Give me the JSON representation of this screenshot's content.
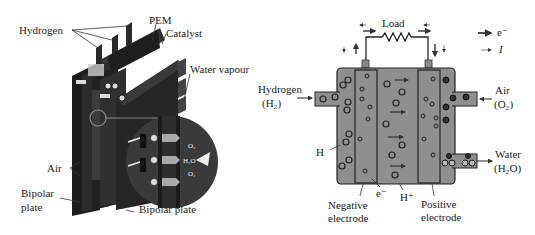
{
  "left_figure": {
    "labels": {
      "hydrogen": "Hydrogen",
      "pem": "PEM",
      "catalyst": "Catalyst",
      "water_vapour": "Water vapour",
      "air": "Air",
      "bipolar_plate_left_1": "Bipolar",
      "bipolar_plate_left_2": "plate",
      "bipolar_plate_right": "Bipolar plate"
    },
    "inset_labels": {
      "o2_top": "O₂",
      "h2o": "H₂O",
      "o2_bottom": "O₂"
    }
  },
  "right_figure": {
    "labels": {
      "load": "Load",
      "hydrogen": "Hydrogen",
      "hydrogen_formula": "(H₂)",
      "air": "Air",
      "air_formula": "(O₂)",
      "water": "Water",
      "water_formula": "(H₂O)",
      "h": "H",
      "electron": "e⁻",
      "proton": "H⁺",
      "negative_electrode_1": "Negative",
      "negative_electrode_2": "electrode",
      "positive_electrode_1": "Positive",
      "positive_electrode_2": "electrode"
    },
    "legend": [
      {
        "symbol": "thick-arrow",
        "label": "e⁻"
      },
      {
        "symbol": "thin-arrow",
        "label": "I"
      }
    ]
  }
}
